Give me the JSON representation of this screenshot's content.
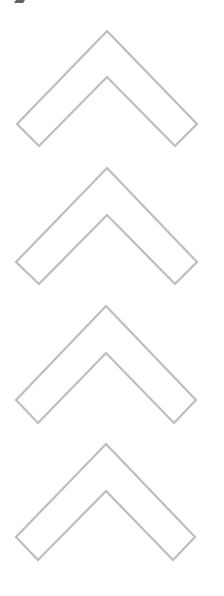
{
  "canvas": {
    "width": 224,
    "height": 596,
    "background": "#ffffff"
  },
  "style": {
    "stroke_color": "#bdbdbd",
    "mark_color": "#444444"
  },
  "chevrons": [
    {
      "direction": "up",
      "points": "107,31 197,124 175,146 107,77 39,146 17,124"
    },
    {
      "direction": "up",
      "points": "107,168 197,262 175,284 107,215 39,284 16,262"
    },
    {
      "direction": "up",
      "points": "106,306 196,400 174,423 106,353 38,423 16,400"
    },
    {
      "direction": "up",
      "points": "106,444 195,537 173,560 106,491 38,560 16,537"
    }
  ]
}
